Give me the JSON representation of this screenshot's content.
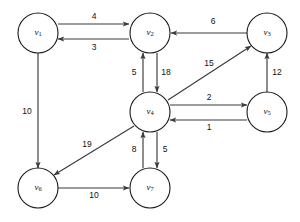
{
  "diagram": {
    "stroke_color": "#3b3b3b",
    "node_stroke_color": "#1a1a1a",
    "background": "#ffffff",
    "node_radius": 20
  },
  "nodes": [
    {
      "id": "v1",
      "base": "v",
      "sub": "1",
      "cx": 38,
      "cy": 33
    },
    {
      "id": "v2",
      "base": "v",
      "sub": "2",
      "cx": 150,
      "cy": 33
    },
    {
      "id": "v3",
      "base": "v",
      "sub": "3",
      "cx": 267,
      "cy": 33
    },
    {
      "id": "v4",
      "base": "v",
      "sub": "4",
      "cx": 150,
      "cy": 112
    },
    {
      "id": "v5",
      "base": "v",
      "sub": "5",
      "cx": 267,
      "cy": 112
    },
    {
      "id": "v6",
      "base": "v",
      "sub": "6",
      "cx": 38,
      "cy": 188
    },
    {
      "id": "v7",
      "base": "v",
      "sub": "7",
      "cx": 150,
      "cy": 188
    }
  ],
  "edges": [
    {
      "from": "v1",
      "to": "v2",
      "weight": "4",
      "lx": 94,
      "ly": 17,
      "x1": 58,
      "y1": 24,
      "x2": 129,
      "y2": 24
    },
    {
      "from": "v2",
      "to": "v1",
      "weight": "3",
      "lx": 94,
      "ly": 48,
      "x1": 129,
      "y1": 39,
      "x2": 58,
      "y2": 39
    },
    {
      "from": "v3",
      "to": "v2",
      "weight": "6",
      "lx": 213,
      "ly": 22,
      "x1": 247,
      "y1": 33,
      "x2": 171,
      "y2": 33
    },
    {
      "from": "v4",
      "to": "v2",
      "weight": "5",
      "lx": 134,
      "ly": 73,
      "x1": 143,
      "y1": 92,
      "x2": 143,
      "y2": 53
    },
    {
      "from": "v2",
      "to": "v4",
      "weight": "18",
      "lx": 166,
      "ly": 73,
      "x1": 157,
      "y1": 53,
      "x2": 157,
      "y2": 92
    },
    {
      "from": "v4",
      "to": "v3",
      "weight": "15",
      "lx": 209,
      "ly": 64,
      "x1": 168,
      "y1": 100,
      "x2": 251,
      "y2": 46
    },
    {
      "from": "v5",
      "to": "v3",
      "weight": "12",
      "lx": 277,
      "ly": 73,
      "x1": 267,
      "y1": 92,
      "x2": 267,
      "y2": 53
    },
    {
      "from": "v4",
      "to": "v5",
      "weight": "2",
      "lx": 209,
      "ly": 98,
      "x1": 170,
      "y1": 105,
      "x2": 247,
      "y2": 105
    },
    {
      "from": "v5",
      "to": "v4",
      "weight": "1",
      "lx": 209,
      "ly": 128,
      "x1": 247,
      "y1": 120,
      "x2": 170,
      "y2": 120
    },
    {
      "from": "v1",
      "to": "v6",
      "weight": "10",
      "lx": 27,
      "ly": 112,
      "x1": 38,
      "y1": 53,
      "x2": 38,
      "y2": 168
    },
    {
      "from": "v4",
      "to": "v6",
      "weight": "19",
      "lx": 87,
      "ly": 145,
      "x1": 134,
      "y1": 126,
      "x2": 54,
      "y2": 175
    },
    {
      "from": "v7",
      "to": "v4",
      "weight": "8",
      "lx": 134,
      "ly": 150,
      "x1": 143,
      "y1": 168,
      "x2": 143,
      "y2": 132
    },
    {
      "from": "v4",
      "to": "v7",
      "weight": "5",
      "lx": 165,
      "ly": 150,
      "x1": 157,
      "y1": 132,
      "x2": 157,
      "y2": 168
    },
    {
      "from": "v6",
      "to": "v7",
      "weight": "10",
      "lx": 94,
      "ly": 196,
      "x1": 58,
      "y1": 188,
      "x2": 129,
      "y2": 188
    }
  ]
}
